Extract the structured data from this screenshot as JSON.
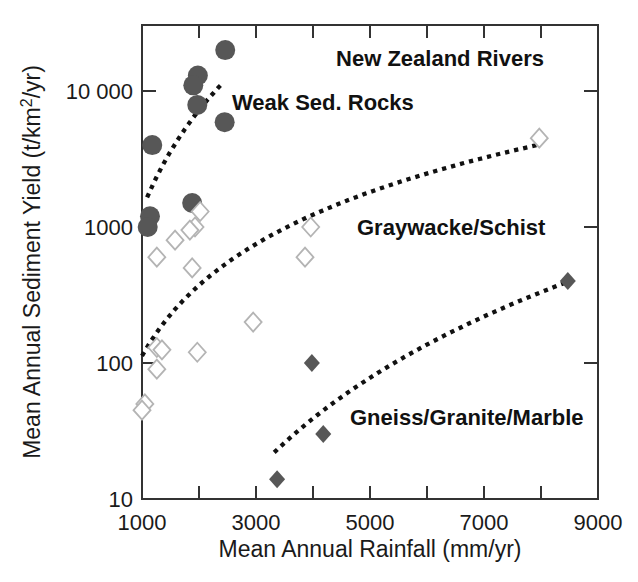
{
  "figure": {
    "width": 638,
    "height": 582,
    "background": "#ffffff"
  },
  "chart_data": {
    "type": "scatter",
    "title": "New Zealand Rivers",
    "xlabel": "Mean Annual Rainfall (mm/yr)",
    "ylabel": "Mean Annual Sediment Yield (t/km²/yr)",
    "x_axis": {
      "scale": "linear",
      "min": 1000,
      "max": 9000,
      "labeled_ticks": [
        1000,
        3000,
        5000,
        7000,
        9000
      ],
      "tick_marks": [
        2000,
        3000,
        4000,
        5000,
        6000,
        7000,
        8000
      ]
    },
    "y_axis": {
      "scale": "log",
      "min": 10,
      "max": 30600,
      "labeled_ticks": [
        {
          "value": 10,
          "label": "10"
        },
        {
          "value": 100,
          "label": "100"
        },
        {
          "value": 1000,
          "label": "1000"
        },
        {
          "value": 10000,
          "label": "10 000"
        }
      ]
    },
    "grid": false,
    "legend": "none-labels-annotated-inside-plot",
    "series": [
      {
        "name": "Weak Sed. Rocks",
        "marker": "filled-circle",
        "color": "#575757",
        "points": [
          [
            2460,
            20000
          ],
          [
            1980,
            13000
          ],
          [
            1900,
            11000
          ],
          [
            1970,
            7900
          ],
          [
            2450,
            5900
          ],
          [
            1180,
            4000
          ],
          [
            1880,
            1500
          ],
          [
            1140,
            1200
          ],
          [
            1100,
            1000
          ]
        ]
      },
      {
        "name": "Graywacke/Schist",
        "marker": "open-diamond",
        "color": "#ffffff",
        "stroke": "#b4b4b4",
        "points": [
          [
            7970,
            4500
          ],
          [
            2020,
            1300
          ],
          [
            3960,
            1000
          ],
          [
            1930,
            1000
          ],
          [
            1840,
            950
          ],
          [
            1580,
            800
          ],
          [
            1260,
            600
          ],
          [
            3860,
            600
          ],
          [
            1880,
            500
          ],
          [
            2950,
            200
          ],
          [
            1260,
            130
          ],
          [
            1350,
            125
          ],
          [
            1970,
            120
          ],
          [
            1260,
            90
          ],
          [
            1050,
            50
          ],
          [
            1000,
            45
          ]
        ]
      },
      {
        "name": "Gneiss/Granite/Marble",
        "marker": "filled-diamond",
        "color": "#575757",
        "points": [
          [
            8470,
            400
          ],
          [
            3980,
            100
          ],
          [
            4180,
            30
          ],
          [
            3370,
            14
          ]
        ]
      }
    ],
    "trend_curves": [
      {
        "series": "Weak Sed. Rocks",
        "style": "dotted",
        "color": "#111111",
        "from": [
          1090,
          1650
        ],
        "to": [
          2420,
          11500
        ]
      },
      {
        "series": "Graywacke/Schist",
        "style": "dotted",
        "color": "#111111",
        "from": [
          1000,
          113
        ],
        "to": [
          7930,
          4000
        ]
      },
      {
        "series": "Gneiss/Granite/Marble",
        "style": "dotted",
        "color": "#111111",
        "from": [
          3320,
          22
        ],
        "to": [
          8430,
          390
        ]
      }
    ],
    "annotations": [
      {
        "text": "New Zealand Rivers",
        "role": "chart-title",
        "px": [
          440,
          66
        ],
        "anchor": "middle"
      },
      {
        "text": "Weak Sed. Rocks",
        "role": "series-label",
        "px": [
          232,
          110
        ],
        "anchor": "start"
      },
      {
        "text": "Graywacke/Schist",
        "role": "series-label",
        "px": [
          357,
          235
        ],
        "anchor": "start"
      },
      {
        "text": "Gneiss/Granite/Marble",
        "role": "series-label",
        "px": [
          350,
          425
        ],
        "anchor": "start"
      }
    ],
    "colors": {
      "axis": "#333333",
      "text": "#1a1a1a",
      "curve": "#111111"
    }
  },
  "plot_layout": {
    "left": 142,
    "right": 598,
    "top": 25,
    "bottom": 499,
    "decade_px": 136
  }
}
